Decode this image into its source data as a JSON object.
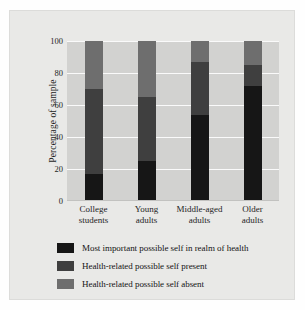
{
  "chart_data": {
    "type": "bar",
    "subtype": "stacked-percent",
    "title": "",
    "xlabel": "",
    "ylabel": "Percentage of sample",
    "ylim": [
      0,
      100
    ],
    "yticks": [
      0,
      20,
      40,
      60,
      80,
      100
    ],
    "ytick_labels": [
      "0",
      "20",
      "40",
      "60",
      "80",
      "100"
    ],
    "grid": true,
    "grid_axis": "y",
    "legend_position": "bottom-left",
    "categories": [
      "College students",
      "Young adults",
      "Middle-aged adults",
      "Older adults"
    ],
    "category_lines": [
      [
        "College",
        "students"
      ],
      [
        "Young",
        "adults"
      ],
      [
        "Middle-aged",
        "adults"
      ],
      [
        "Older",
        "adults"
      ]
    ],
    "series": [
      {
        "name": "Most important possible self in realm of health",
        "color": "#161616",
        "values": [
          17,
          25,
          54,
          72
        ]
      },
      {
        "name": "Health-related possible self present",
        "color": "#3f3f3f",
        "values": [
          53,
          40,
          33,
          13
        ]
      },
      {
        "name": "Health-related possible self absent",
        "color": "#6e6e6e",
        "values": [
          30,
          35,
          13,
          15
        ]
      }
    ],
    "cumulative_tops": [
      [
        17,
        70,
        100
      ],
      [
        25,
        65,
        100
      ],
      [
        54,
        87,
        100
      ],
      [
        72,
        85,
        100
      ]
    ]
  },
  "legend": {
    "items": [
      {
        "label": "Most important possible self in realm of health",
        "color": "#161616"
      },
      {
        "label": "Health-related possible self present",
        "color": "#3f3f3f"
      },
      {
        "label": "Health-related possible self absent",
        "color": "#6e6e6e"
      }
    ]
  },
  "colors": {
    "plot_background": "#d2d2d0",
    "plate_background": "#e9e9e7",
    "gridline": "#fafafa",
    "text": "#1e1e1e"
  }
}
